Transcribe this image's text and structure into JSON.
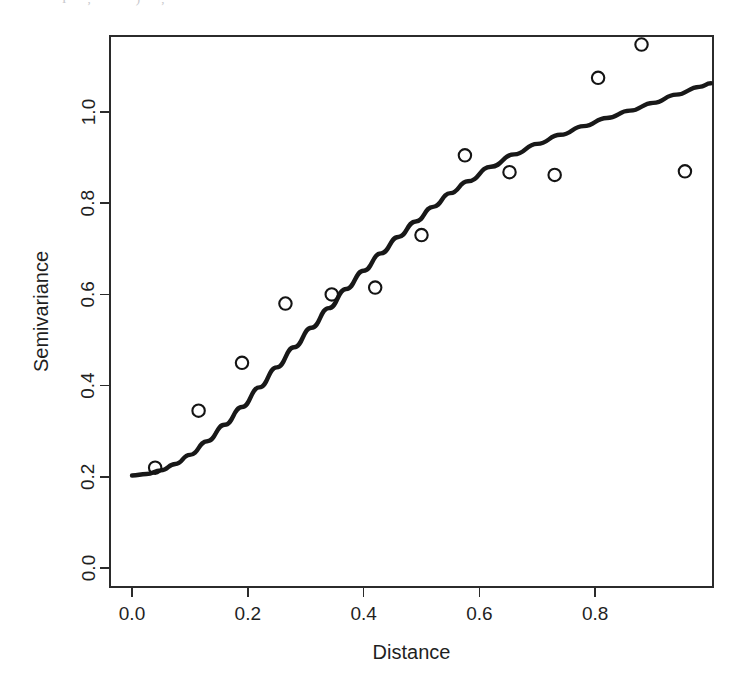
{
  "figure": {
    "width": 746,
    "height": 686,
    "background": "#ffffff",
    "scan_artifact_text": "I , ' ) ,"
  },
  "chart_data": {
    "type": "scatter",
    "title": "",
    "subtitle": "",
    "xlabel": "Distance",
    "ylabel": "Semivariance",
    "xlim": [
      -0.035,
      1.005
    ],
    "ylim": [
      -0.035,
      1.215
    ],
    "grid": false,
    "legend": null,
    "legend_position": "none",
    "xticks": [
      0.0,
      0.2,
      0.4,
      0.6,
      0.8
    ],
    "xticklabels": [
      "0.0",
      "0.2",
      "0.4",
      "0.6",
      "0.8"
    ],
    "yticks": [
      0.0,
      0.2,
      0.4,
      0.6,
      0.8,
      1.0
    ],
    "yticklabels": [
      "0.0",
      "0.2",
      "0.4",
      "0.6",
      "0.8",
      "1.0"
    ],
    "series": [
      {
        "name": "Empirical semivariance",
        "type": "scatter",
        "marker": "open-circle",
        "color": "#141414",
        "x": [
          0.04,
          0.115,
          0.19,
          0.265,
          0.345,
          0.42,
          0.5,
          0.575,
          0.652,
          0.73,
          0.805,
          0.88,
          0.955
        ],
        "y": [
          0.22,
          0.345,
          0.45,
          0.58,
          0.6,
          0.615,
          0.73,
          0.905,
          0.868,
          0.862,
          1.075,
          1.148,
          0.87
        ]
      },
      {
        "name": "Fitted model",
        "type": "line",
        "color": "#181818",
        "x": [
          0.0,
          0.025,
          0.05,
          0.075,
          0.1,
          0.13,
          0.16,
          0.19,
          0.22,
          0.25,
          0.28,
          0.31,
          0.34,
          0.37,
          0.4,
          0.43,
          0.46,
          0.49,
          0.52,
          0.55,
          0.58,
          0.62,
          0.66,
          0.7,
          0.74,
          0.78,
          0.82,
          0.86,
          0.9,
          0.94,
          0.98,
          1.0
        ],
        "y": [
          0.203,
          0.206,
          0.214,
          0.228,
          0.248,
          0.278,
          0.314,
          0.353,
          0.396,
          0.44,
          0.484,
          0.527,
          0.57,
          0.612,
          0.652,
          0.69,
          0.726,
          0.76,
          0.792,
          0.822,
          0.848,
          0.88,
          0.907,
          0.93,
          0.95,
          0.969,
          0.987,
          1.003,
          1.02,
          1.038,
          1.055,
          1.063
        ]
      }
    ]
  },
  "geometry": {
    "plot_left": 110,
    "plot_right": 713,
    "plot_top": 36,
    "plot_bottom": 587,
    "x_origin_px": 132,
    "x_scale_px_per_unit": 579,
    "y_origin_px": 568,
    "y_scale_px_per_unit": 456,
    "marker_radius_px": 6.2
  }
}
